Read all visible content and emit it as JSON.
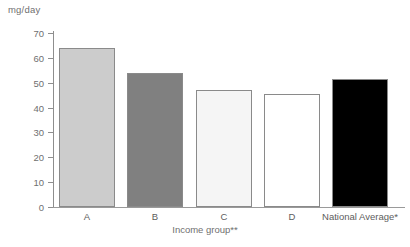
{
  "chart_data": {
    "type": "bar",
    "title": "",
    "subtitle": "",
    "xlabel": "Income group**",
    "ylabel": "mg/day",
    "categories": [
      "A",
      "B",
      "C",
      "D",
      "National Average*"
    ],
    "values": [
      64,
      54,
      47,
      45.5,
      51.5
    ],
    "ylim": [
      0,
      70
    ],
    "yticks": [
      0,
      10,
      20,
      30,
      40,
      50,
      60,
      70
    ],
    "ytick_labels": [
      "0",
      "10",
      "20",
      "30",
      "40",
      "50",
      "60",
      "70"
    ],
    "grid": false,
    "legend": "none",
    "bar_colors": [
      "#cccccc",
      "#808080",
      "#f5f5f5",
      "#ffffff",
      "#000000"
    ],
    "bar_border_color": "#8a8a8a",
    "axis_color": "#8e8e8e",
    "text_color": "#6f6f6f"
  },
  "axes": {
    "y_unit_caption": "mg/day",
    "x_axis_title": "Income group**"
  },
  "bars": [
    {
      "label": "A",
      "value": 64,
      "color": "#cccccc"
    },
    {
      "label": "B",
      "value": 54,
      "color": "#808080"
    },
    {
      "label": "C",
      "value": 47,
      "color": "#f5f5f5"
    },
    {
      "label": "D",
      "value": 45.5,
      "color": "#ffffff"
    },
    {
      "label": "National Average*",
      "value": 51.5,
      "color": "#000000"
    }
  ],
  "yticks": [
    {
      "label": "70",
      "value": 70
    },
    {
      "label": "60",
      "value": 60
    },
    {
      "label": "50",
      "value": 50
    },
    {
      "label": "40",
      "value": 40
    },
    {
      "label": "30",
      "value": 30
    },
    {
      "label": "20",
      "value": 20
    },
    {
      "label": "10",
      "value": 10
    },
    {
      "label": "0",
      "value": 0
    }
  ]
}
